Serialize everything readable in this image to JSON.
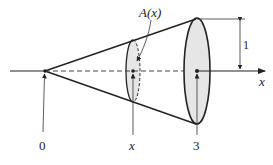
{
  "diagram": {
    "type": "cone-volume-cross-section",
    "labels": {
      "cross_section_area": "A(x)",
      "origin": "0",
      "cross_section_position": "x",
      "cone_end": "3",
      "axis": "x",
      "radius_dimension": "1"
    },
    "colors": {
      "stroke": "#222222",
      "fill": "#e6e6e6",
      "background": "#ffffff"
    }
  }
}
